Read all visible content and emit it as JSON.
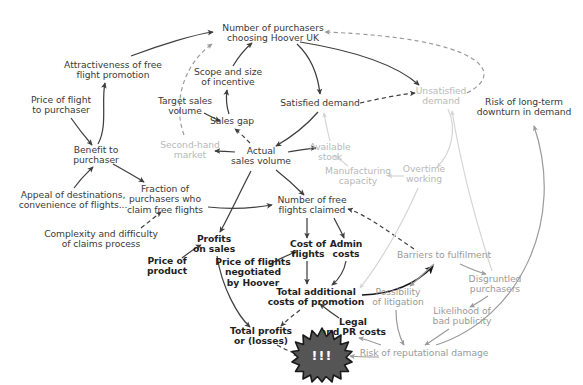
{
  "diagram": {
    "type": "causal-loop-diagram",
    "canvas": {
      "width": 583,
      "height": 385
    },
    "background": "#ffffff",
    "colors": {
      "text_normal": "#3a3a3a",
      "text_bold": "#1f1f1f",
      "text_faded": "#b9b9b9",
      "text_mid": "#9a9a9a",
      "edge_dark": "#3f3f3f",
      "edge_black": "#161616",
      "edge_mid": "#9a9a9a",
      "edge_faded": "#d5d5d5",
      "burst_fill": "#555555",
      "burst_stroke": "#1a1a1a",
      "burst_text": "#ffffff"
    },
    "nodes": [
      {
        "id": "purchasers_hoover",
        "label": "Number of purchasers\nchoosing Hoover UK",
        "x": 273,
        "y": 33,
        "style": "normal"
      },
      {
        "id": "attractiveness",
        "label": "Attractiveness of free\nflight promotion",
        "x": 113,
        "y": 70,
        "style": "normal"
      },
      {
        "id": "scope_incentive",
        "label": "Scope and size\nof incentive",
        "x": 228,
        "y": 77,
        "style": "normal"
      },
      {
        "id": "price_flight_purchaser",
        "label": "Price of flight\nto purchaser",
        "x": 61,
        "y": 105,
        "style": "normal"
      },
      {
        "id": "target_sales_volume",
        "label": "Target sales\nvolume",
        "x": 185,
        "y": 106,
        "style": "normal"
      },
      {
        "id": "satisfied_demand",
        "label": "Satisfied demand",
        "x": 320,
        "y": 103,
        "style": "normal"
      },
      {
        "id": "unsatisfied_demand",
        "label": "Unsatisfied\ndemand",
        "x": 441,
        "y": 96,
        "style": "faded"
      },
      {
        "id": "risk_downturn",
        "label": "Risk of long-term\ndownturn in demand",
        "x": 524,
        "y": 107,
        "style": "normal"
      },
      {
        "id": "sales_gap",
        "label": "Sales gap",
        "x": 232,
        "y": 121,
        "style": "normal"
      },
      {
        "id": "available_stock",
        "label": "Available\nstock",
        "x": 330,
        "y": 152,
        "style": "faded"
      },
      {
        "id": "second_hand_market",
        "label": "Second-hand\nmarket",
        "x": 190,
        "y": 150,
        "style": "faded"
      },
      {
        "id": "benefit_purchaser",
        "label": "Benefit to\npurchaser",
        "x": 96,
        "y": 155,
        "style": "normal"
      },
      {
        "id": "actual_sales_volume",
        "label": "Actual\nsales volume",
        "x": 261,
        "y": 156,
        "style": "normal"
      },
      {
        "id": "manufacturing_capacity",
        "label": "Manufacturing\ncapacity",
        "x": 358,
        "y": 176,
        "style": "faded"
      },
      {
        "id": "overtime_working",
        "label": "Overtime\nworking",
        "x": 424,
        "y": 174,
        "style": "faded"
      },
      {
        "id": "appeal_destinations",
        "label": "Appeal of destinations,\nconvenience of flights...",
        "x": 73,
        "y": 200,
        "style": "normal"
      },
      {
        "id": "fraction_claim",
        "label": "Fraction of\npurchasers who\nclaim free flights",
        "x": 165,
        "y": 199,
        "style": "normal"
      },
      {
        "id": "free_flights_claimed",
        "label": "Number of free\nflights claimed",
        "x": 312,
        "y": 205,
        "style": "normal"
      },
      {
        "id": "complexity_claims",
        "label": "Complexity and difficulty\nof claims process",
        "x": 101,
        "y": 239,
        "style": "normal"
      },
      {
        "id": "profits_on_sales",
        "label": "Profits\non sales",
        "x": 214,
        "y": 244,
        "style": "bold"
      },
      {
        "id": "cost_of_flights",
        "label": "Cost of\nflights",
        "x": 308,
        "y": 249,
        "style": "bold"
      },
      {
        "id": "admin_costs",
        "label": "Admin\ncosts",
        "x": 346,
        "y": 249,
        "style": "bold"
      },
      {
        "id": "barriers_fulfilment",
        "label": "Barriers to fulfilment",
        "x": 444,
        "y": 255,
        "style": "mid"
      },
      {
        "id": "price_of_product",
        "label": "Price of\nproduct",
        "x": 167,
        "y": 266,
        "style": "bold"
      },
      {
        "id": "price_flights_negotiated",
        "label": "Price of flights\nnegotiated\nby Hoover",
        "x": 253,
        "y": 272,
        "style": "bold"
      },
      {
        "id": "total_additional_costs",
        "label": "Total additional\ncosts of promotion",
        "x": 316,
        "y": 297,
        "style": "bold"
      },
      {
        "id": "possibility_litigation",
        "label": "Possibility\nof litigation",
        "x": 398,
        "y": 297,
        "style": "mid"
      },
      {
        "id": "disgruntled_purchasers",
        "label": "Disgruntled\npurchasers",
        "x": 495,
        "y": 284,
        "style": "mid"
      },
      {
        "id": "likelihood_bad_publicity",
        "label": "Likelihood of\nbad publicity",
        "x": 462,
        "y": 316,
        "style": "mid"
      },
      {
        "id": "legal_pr_costs",
        "label": "Legal\nand PR costs",
        "x": 353,
        "y": 327,
        "style": "bold"
      },
      {
        "id": "total_profits_losses",
        "label": "Total profits\nor (losses)",
        "x": 261,
        "y": 336,
        "style": "bold"
      },
      {
        "id": "risk_reputational_damage",
        "label": "Risk of reputational damage",
        "x": 424,
        "y": 353,
        "style": "mid"
      }
    ],
    "burst": {
      "id": "crisis-burst",
      "label": "!!!",
      "x": 322,
      "y": 355
    },
    "edges": [
      {
        "from": "attractiveness",
        "to": "purchasers_hoover",
        "style": "solid",
        "tone": "dark"
      },
      {
        "from": "price_flight_purchaser",
        "to": "benefit_purchaser",
        "style": "solid",
        "tone": "dark"
      },
      {
        "from": "benefit_purchaser",
        "to": "attractiveness",
        "style": "solid",
        "tone": "dark"
      },
      {
        "from": "appeal_destinations",
        "to": "benefit_purchaser",
        "style": "solid",
        "tone": "dark"
      },
      {
        "from": "benefit_purchaser",
        "to": "fraction_claim",
        "style": "solid",
        "tone": "dark"
      },
      {
        "from": "complexity_claims",
        "to": "fraction_claim",
        "style": "dashed",
        "tone": "dark"
      },
      {
        "from": "second_hand_market",
        "to": "purchasers_hoover",
        "style": "dashed",
        "tone": "mid"
      },
      {
        "from": "target_sales_volume",
        "to": "sales_gap",
        "style": "solid",
        "tone": "dark"
      },
      {
        "from": "sales_gap",
        "to": "scope_incentive",
        "style": "solid",
        "tone": "dark"
      },
      {
        "from": "scope_incentive",
        "to": "purchasers_hoover",
        "style": "solid",
        "tone": "dark"
      },
      {
        "from": "actual_sales_volume",
        "to": "sales_gap",
        "style": "dashed",
        "tone": "dark"
      },
      {
        "from": "purchasers_hoover",
        "to": "satisfied_demand",
        "style": "solid",
        "tone": "dark"
      },
      {
        "from": "satisfied_demand",
        "to": "actual_sales_volume",
        "style": "solid",
        "tone": "dark"
      },
      {
        "from": "actual_sales_volume",
        "to": "second_hand_market",
        "style": "solid",
        "tone": "dark"
      },
      {
        "from": "actual_sales_volume",
        "to": "available_stock",
        "style": "solid",
        "tone": "dark"
      },
      {
        "from": "purchasers_hoover",
        "to": "unsatisfied_demand",
        "style": "solid",
        "tone": "dark"
      },
      {
        "from": "satisfied_demand",
        "to": "unsatisfied_demand",
        "style": "dashed",
        "tone": "dark"
      },
      {
        "from": "unsatisfied_demand",
        "to": "purchasers_hoover",
        "style": "dashed",
        "tone": "mid"
      },
      {
        "from": "available_stock",
        "to": "satisfied_demand",
        "style": "solid",
        "tone": "faded"
      },
      {
        "from": "manufacturing_capacity",
        "to": "available_stock",
        "style": "solid",
        "tone": "faded"
      },
      {
        "from": "overtime_working",
        "to": "manufacturing_capacity",
        "style": "solid",
        "tone": "faded"
      },
      {
        "from": "unsatisfied_demand",
        "to": "overtime_working",
        "style": "solid",
        "tone": "faded"
      },
      {
        "from": "actual_sales_volume",
        "to": "free_flights_claimed",
        "style": "solid",
        "tone": "dark"
      },
      {
        "from": "fraction_claim",
        "to": "free_flights_claimed",
        "style": "solid",
        "tone": "dark"
      },
      {
        "from": "actual_sales_volume",
        "to": "profits_on_sales",
        "style": "solid",
        "tone": "dark"
      },
      {
        "from": "price_of_product",
        "to": "profits_on_sales",
        "style": "solid",
        "tone": "dark"
      },
      {
        "from": "profits_on_sales",
        "to": "total_profits_losses",
        "style": "solid",
        "tone": "dark"
      },
      {
        "from": "free_flights_claimed",
        "to": "cost_of_flights",
        "style": "solid",
        "tone": "dark"
      },
      {
        "from": "free_flights_claimed",
        "to": "admin_costs",
        "style": "solid",
        "tone": "dark"
      },
      {
        "from": "price_flights_negotiated",
        "to": "cost_of_flights",
        "style": "solid",
        "tone": "dark"
      },
      {
        "from": "cost_of_flights",
        "to": "total_additional_costs",
        "style": "solid",
        "tone": "dark"
      },
      {
        "from": "admin_costs",
        "to": "total_additional_costs",
        "style": "solid",
        "tone": "dark"
      },
      {
        "from": "legal_pr_costs",
        "to": "total_additional_costs",
        "style": "solid",
        "tone": "dark"
      },
      {
        "from": "total_additional_costs",
        "to": "total_profits_losses",
        "style": "dashed",
        "tone": "dark"
      },
      {
        "from": "total_additional_costs",
        "to": "barriers_fulfilment",
        "style": "solid",
        "tone": "black"
      },
      {
        "from": "barriers_fulfilment",
        "to": "free_flights_claimed",
        "style": "dashed",
        "tone": "dark"
      },
      {
        "from": "barriers_fulfilment",
        "to": "possibility_litigation",
        "style": "solid",
        "tone": "mid"
      },
      {
        "from": "barriers_fulfilment",
        "to": "disgruntled_purchasers",
        "style": "solid",
        "tone": "mid"
      },
      {
        "from": "disgruntled_purchasers",
        "to": "likelihood_bad_publicity",
        "style": "solid",
        "tone": "mid"
      },
      {
        "from": "possibility_litigation",
        "to": "risk_reputational_damage",
        "style": "solid",
        "tone": "mid"
      },
      {
        "from": "likelihood_bad_publicity",
        "to": "risk_reputational_damage",
        "style": "solid",
        "tone": "mid"
      },
      {
        "from": "risk_reputational_damage",
        "to": "legal_pr_costs",
        "style": "solid",
        "tone": "mid"
      },
      {
        "from": "risk_reputational_damage",
        "to": "crisis-burst",
        "style": "solid",
        "tone": "mid"
      },
      {
        "from": "total_profits_losses",
        "to": "crisis-burst",
        "style": "dashed",
        "tone": "dark"
      },
      {
        "from": "risk_reputational_damage",
        "to": "risk_downturn",
        "style": "solid",
        "tone": "mid"
      },
      {
        "from": "disgruntled_purchasers",
        "to": "unsatisfied_demand",
        "style": "solid",
        "tone": "faded"
      },
      {
        "from": "overtime_working",
        "to": "total_additional_costs",
        "style": "solid",
        "tone": "faded"
      }
    ]
  }
}
